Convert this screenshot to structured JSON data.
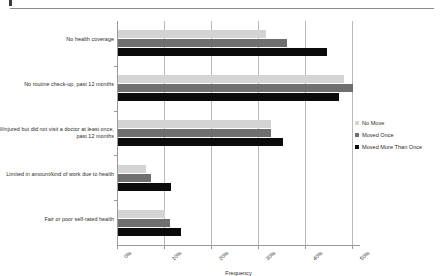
{
  "header": {
    "mark": "",
    "rule": ""
  },
  "chart_data": {
    "type": "bar",
    "orientation": "horizontal",
    "title": "",
    "xlabel": "Frequency",
    "ylabel": "",
    "xlim": [
      0,
      50
    ],
    "xticks": [
      "0%",
      "10%",
      "20%",
      "30%",
      "40%",
      "50%"
    ],
    "xtick_values": [
      0,
      10,
      20,
      30,
      40,
      50
    ],
    "grid": true,
    "grid_axis": "x",
    "legend_position": "right",
    "categories": [
      "No health coverage",
      "No routine check-up, past 12 months",
      "Ill/injured but did not visit a doctor at least once, past 12 months",
      "Limited in amount/kind of work due to health",
      "Fair or poor self-rated health"
    ],
    "series": [
      {
        "name": "No Move",
        "color": "#d4d4d4",
        "values": [
          31.5,
          48.0,
          32.5,
          6.0,
          10.0
        ]
      },
      {
        "name": "Moved Once",
        "color": "#6f6f6f",
        "values": [
          36.0,
          50.0,
          32.5,
          7.0,
          11.0
        ]
      },
      {
        "name": "Moved More Than Once",
        "color": "#0b0b0b",
        "values": [
          44.5,
          47.0,
          35.0,
          11.3,
          13.5
        ]
      }
    ]
  }
}
